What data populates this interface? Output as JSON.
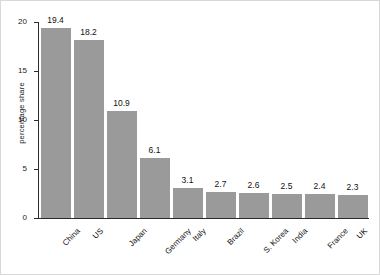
{
  "chart_data": {
    "type": "bar",
    "title": "",
    "subtitle": "",
    "xlabel": "",
    "ylabel": "percentage share",
    "ylim": [
      0,
      20
    ],
    "yticks": [
      0,
      5,
      10,
      15,
      20
    ],
    "ytick_labels": [
      "0",
      "5",
      "10",
      "15",
      "20"
    ],
    "grid": false,
    "legend": false,
    "orientation": "vertical",
    "bar_color": "#9a9a9a",
    "axis_color": "#2b2b2b",
    "text_color": "#111111",
    "xtick_rotation": -45,
    "categories": [
      "China",
      "US",
      "Japan",
      "Germany",
      "Italy",
      "Brazil",
      "S. Korea",
      "India",
      "France",
      "UK"
    ],
    "values": [
      19.4,
      18.2,
      10.9,
      6.1,
      3.1,
      2.7,
      2.6,
      2.5,
      2.4,
      2.3
    ],
    "value_labels": [
      "19.4",
      "18.2",
      "10.9",
      "6.1",
      "3.1",
      "2.7",
      "2.6",
      "2.5",
      "2.4",
      "2.3"
    ],
    "bars": [
      {
        "category": "China",
        "value": 19.4,
        "label": "19.4"
      },
      {
        "category": "US",
        "value": 18.2,
        "label": "18.2"
      },
      {
        "category": "Japan",
        "value": 10.9,
        "label": "10.9"
      },
      {
        "category": "Germany",
        "value": 6.1,
        "label": "6.1"
      },
      {
        "category": "Italy",
        "value": 3.1,
        "label": "3.1"
      },
      {
        "category": "Brazil",
        "value": 2.7,
        "label": "2.7"
      },
      {
        "category": "S. Korea",
        "value": 2.6,
        "label": "2.6"
      },
      {
        "category": "India",
        "value": 2.5,
        "label": "2.5"
      },
      {
        "category": "France",
        "value": 2.4,
        "label": "2.4"
      },
      {
        "category": "UK",
        "value": 2.3,
        "label": "2.3"
      }
    ]
  }
}
